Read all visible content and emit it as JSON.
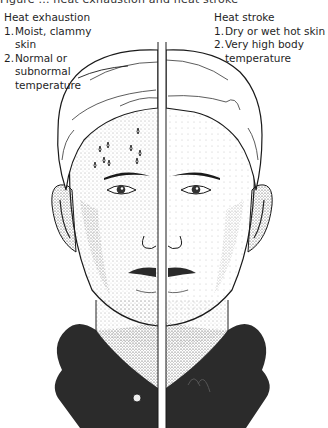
{
  "figure": {
    "top_caption_cropped": "Figure  ...  heat exhaustion and heat stroke",
    "colors": {
      "ink": "#1a1a1a",
      "shirt": "#2b2b2b",
      "background": "#ffffff",
      "stipple": "#555555"
    }
  },
  "left_panel": {
    "title": "Heat exhaustion",
    "items": [
      {
        "num": "1.",
        "text": "Moist, clammy skin"
      },
      {
        "num": "2.",
        "text": "Normal or subnormal temperature"
      }
    ],
    "visual_features": [
      "sweat-drops-on-forehead",
      "stippled-pale-skin"
    ]
  },
  "right_panel": {
    "title": "Heat stroke",
    "items": [
      {
        "num": "1.",
        "text": "Dry or wet hot skin"
      },
      {
        "num": "2.",
        "text": "Very high body temperature"
      }
    ],
    "visual_features": [
      "dry-skin",
      "flushed-face"
    ]
  }
}
